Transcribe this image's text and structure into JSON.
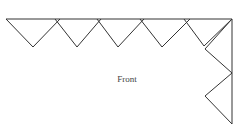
{
  "diagram": {
    "label": "Front",
    "stroke_color": "#333333",
    "top_edge": {
      "x1": 6,
      "y1": 19,
      "x2": 232,
      "y2": 19
    },
    "right_edge": {
      "x1": 232,
      "y1": 19,
      "x2": 232,
      "y2": 124
    },
    "top_triangles": [
      {
        "points": "6,19 33,47 60,19"
      },
      {
        "points": "55,19 77,47 101,19"
      },
      {
        "points": "97,19 118,47 144,19"
      },
      {
        "points": "140,19 162,47 190,19"
      },
      {
        "points": "184,19 204,46 232,19"
      }
    ],
    "side_triangles": [
      {
        "points": "232,19 205,49 232,73"
      },
      {
        "points": "232,73 205,96 232,124"
      }
    ]
  }
}
